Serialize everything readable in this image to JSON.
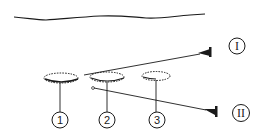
{
  "diagram": {
    "type": "technical-line-drawing",
    "colors": {
      "stroke": "#1a1a1a",
      "background": "#ffffff"
    },
    "surface_line": {
      "name": "wavy-top-line"
    },
    "elements": [
      {
        "id": "1",
        "label": "1",
        "shape": "dashed-ellipse"
      },
      {
        "id": "2",
        "label": "2",
        "shape": "dashed-ellipse"
      },
      {
        "id": "3",
        "label": "3",
        "shape": "dashed-ellipse"
      }
    ],
    "pointers": [
      {
        "id": "I",
        "label": "I",
        "from": "element-2-left",
        "style": "line-with-wedge"
      },
      {
        "id": "II",
        "label": "II",
        "from": "element-2-left",
        "style": "line-with-wedge"
      }
    ]
  }
}
